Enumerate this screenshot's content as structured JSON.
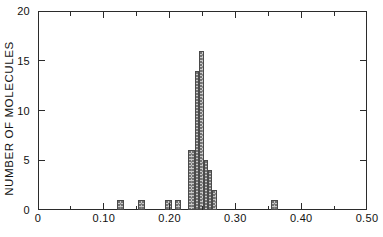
{
  "chart_data": {
    "type": "bar",
    "title": "",
    "subtitle": "",
    "xlabel": "",
    "ylabel": "NUMBER OF MOLECULES",
    "xlim": [
      0,
      0.5
    ],
    "ylim": [
      0,
      20
    ],
    "grid": false,
    "legend": null,
    "bin_width": 0.01,
    "x_major_ticks": [
      0,
      0.1,
      0.2,
      0.3,
      0.4,
      0.5
    ],
    "x_major_tick_labels": [
      "0",
      "0.10",
      "0.20",
      "0.30",
      "0.40",
      "0.50"
    ],
    "x_minor_ticks": [
      0.05,
      0.15,
      0.25,
      0.35,
      0.45
    ],
    "y_major_ticks": [
      0,
      5,
      10,
      15,
      20
    ],
    "y_major_tick_labels": [
      "0",
      "5",
      "10",
      "15",
      "20"
    ],
    "bins": [
      {
        "x0": 0.12,
        "x1": 0.13,
        "value": 1
      },
      {
        "x0": 0.152,
        "x1": 0.162,
        "value": 1
      },
      {
        "x0": 0.193,
        "x1": 0.203,
        "value": 1
      },
      {
        "x0": 0.208,
        "x1": 0.218,
        "value": 1
      },
      {
        "x0": 0.228,
        "x1": 0.238,
        "value": 6
      },
      {
        "x0": 0.238,
        "x1": 0.245,
        "value": 14
      },
      {
        "x0": 0.245,
        "x1": 0.252,
        "value": 16
      },
      {
        "x0": 0.252,
        "x1": 0.258,
        "value": 5
      },
      {
        "x0": 0.258,
        "x1": 0.265,
        "value": 4
      },
      {
        "x0": 0.265,
        "x1": 0.272,
        "value": 2
      },
      {
        "x0": 0.354,
        "x1": 0.364,
        "value": 1
      }
    ],
    "categories": [
      "0.125",
      "0.157",
      "0.198",
      "0.213",
      "0.233",
      "0.2415",
      "0.2485",
      "0.255",
      "0.2615",
      "0.2685",
      "0.359"
    ],
    "values": [
      1,
      1,
      1,
      1,
      6,
      14,
      16,
      5,
      4,
      2,
      1
    ]
  },
  "axes": {
    "frame_color": "#2b2b2b",
    "bar_fill": "#c9c9c9",
    "bar_edge": "#4a4a4a"
  }
}
